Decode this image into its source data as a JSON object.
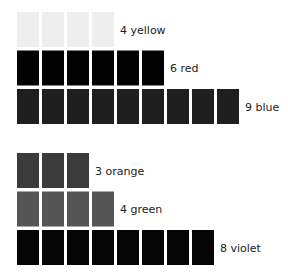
{
  "chart_data": {
    "type": "bar",
    "title": "",
    "xlabel": "",
    "ylabel": "",
    "groups": [
      {
        "name": "group-1",
        "rows": [
          {
            "category": "yellow",
            "count": 4,
            "label": "4 yellow",
            "color": "#eeeeee"
          },
          {
            "category": "red",
            "count": 6,
            "label": "6 red",
            "color": "#020202"
          },
          {
            "category": "blue",
            "count": 9,
            "label": "9 blue",
            "color": "#1f1f1f"
          }
        ]
      },
      {
        "name": "group-2",
        "rows": [
          {
            "category": "orange",
            "count": 3,
            "label": "3 orange",
            "color": "#3b3b3b"
          },
          {
            "category": "green",
            "count": 4,
            "label": "4 green",
            "color": "#555555"
          },
          {
            "category": "violet",
            "count": 8,
            "label": "8 violet",
            "color": "#050505"
          }
        ]
      }
    ]
  }
}
